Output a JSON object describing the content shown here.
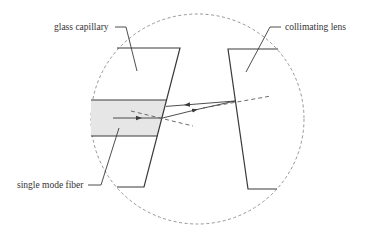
{
  "labels": {
    "glass_capillary": "glass capillary",
    "collimating_lens": "collimating lens",
    "single_mode_fiber": "single mode fiber"
  },
  "colors": {
    "line": "#3a3a3a",
    "dashed": "#8a8a8a",
    "fiber_fill": "#e6e6e6",
    "background": "#ffffff"
  }
}
